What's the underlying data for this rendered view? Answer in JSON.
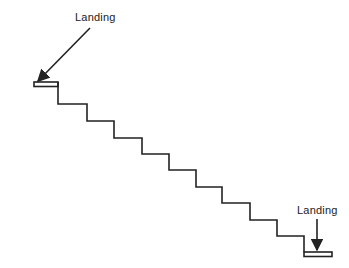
{
  "diagram": {
    "type": "staircase",
    "stroke_color": "#222222",
    "labels": {
      "top_landing": "Landing",
      "bottom_landing": "Landing"
    },
    "step_count": 9
  }
}
